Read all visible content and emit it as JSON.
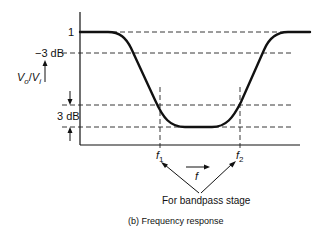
{
  "diagram": {
    "type": "frequency-response",
    "y_axis_label_main": "V",
    "y_axis_label_sub_o": "o",
    "y_axis_label_sep": "/",
    "y_axis_label_sub_i": "i",
    "x_axis_label": "f",
    "levels": {
      "unity": "1",
      "minus3": "−3 dB",
      "band_3db": "3 dB"
    },
    "cutoffs": {
      "f1_main": "f",
      "f1_sub": "1",
      "f2_main": "f",
      "f2_sub": "2"
    },
    "annotation": "For bandpass stage",
    "caption": "(b)  Frequency response"
  }
}
